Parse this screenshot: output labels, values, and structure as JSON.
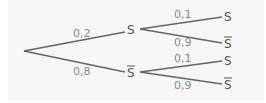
{
  "tree": {
    "level1": [
      {
        "prob": "0,2",
        "node": "S",
        "bar": false
      },
      {
        "prob": "0,8",
        "node": "S",
        "bar": true
      }
    ],
    "level2": [
      {
        "parent": 0,
        "prob": "0,1",
        "node": "S",
        "bar": false
      },
      {
        "parent": 0,
        "prob": "0,9",
        "node": "S",
        "bar": true
      },
      {
        "parent": 1,
        "prob": "0,1",
        "node": "S",
        "bar": false
      },
      {
        "parent": 1,
        "prob": "0,9",
        "node": "S",
        "bar": true
      }
    ]
  },
  "colors": {
    "background": "#f7f7f7",
    "edge": "#666666",
    "label": "#8a8a8a",
    "node": "#555555"
  }
}
